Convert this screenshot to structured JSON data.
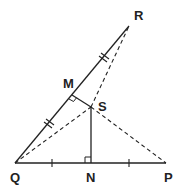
{
  "diagram": {
    "colors": {
      "line": "#222222",
      "background": "#ffffff"
    },
    "points": {
      "R": {
        "label": "R",
        "x": 129,
        "y": 26
      },
      "Q": {
        "label": "Q",
        "x": 15,
        "y": 163
      },
      "P": {
        "label": "P",
        "x": 166,
        "y": 163
      },
      "N": {
        "label": "N",
        "x": 91,
        "y": 163
      },
      "S": {
        "label": "S",
        "x": 91,
        "y": 107
      },
      "M": {
        "label": "M",
        "x": 72,
        "y": 95
      }
    },
    "segments": [
      {
        "from": "Q",
        "to": "R",
        "style": "solid"
      },
      {
        "from": "Q",
        "to": "P",
        "style": "solid"
      },
      {
        "from": "M",
        "to": "S",
        "style": "solid"
      },
      {
        "from": "S",
        "to": "N",
        "style": "solid"
      },
      {
        "from": "Q",
        "to": "S",
        "style": "dashed"
      },
      {
        "from": "S",
        "to": "P",
        "style": "dashed"
      },
      {
        "from": "S",
        "to": "R",
        "style": "dashed"
      }
    ],
    "markings": {
      "QR_equal_ticks": "double",
      "QP_equal_ticks": "single",
      "right_angles": [
        "M",
        "N"
      ]
    }
  }
}
